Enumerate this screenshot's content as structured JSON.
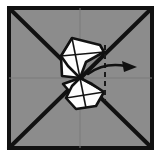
{
  "figure": {
    "title": "Origami fold step diagram",
    "caption": "Square paper with diagonal creases and a central bow-tie flap being folded to the right",
    "canvas": {
      "width": 161,
      "height": 157
    },
    "background_color": "#ffffff"
  },
  "paper": {
    "name": "square-sheet",
    "fill_color": "#8c8c8c",
    "border_color": "#111111",
    "border_width": 4,
    "rect": {
      "x": 7,
      "y": 6,
      "width": 147,
      "height": 144
    }
  },
  "creases": {
    "diagonal_color": "#111111",
    "diagonal_width": 4,
    "center_line_color": "#7b7b7b",
    "center_line_width": 1,
    "diagonals": [
      {
        "name": "crease-diagonal-tl-br",
        "x1": 9,
        "y1": 8,
        "x2": 152,
        "y2": 148
      },
      {
        "name": "crease-diagonal-bl-tr",
        "x1": 9,
        "y1": 148,
        "x2": 152,
        "y2": 8
      }
    ],
    "center_lines": [
      {
        "name": "crease-center-vertical",
        "x1": 80,
        "y1": 8,
        "x2": 80,
        "y2": 148
      },
      {
        "name": "crease-center-horizontal",
        "x1": 9,
        "y1": 78,
        "x2": 152,
        "y2": 78
      }
    ]
  },
  "flaps": {
    "fill_color": "#fdfdfd",
    "outline_color": "#111111",
    "outline_width": 2.6,
    "crease_color": "#111111",
    "crease_width": 1.6,
    "upper": {
      "name": "upper-flap",
      "outline_points": "72,38 100,45 104,52 86,62 80,78 68,66 61,56",
      "internal_creases": [
        {
          "name": "upper-crease-a",
          "x1": 72,
          "y1": 38,
          "x2": 80,
          "y2": 78
        },
        {
          "name": "upper-crease-b",
          "x1": 61,
          "y1": 56,
          "x2": 104,
          "y2": 52
        },
        {
          "name": "upper-crease-c",
          "x1": 72,
          "y1": 38,
          "x2": 61,
          "y2": 56
        }
      ]
    },
    "lower": {
      "name": "lower-flap",
      "outline_points": "80,78 92,84 104,92 96,106 76,109 66,98 72,86",
      "internal_creases": [
        {
          "name": "lower-crease-a",
          "x1": 80,
          "y1": 78,
          "x2": 86,
          "y2": 108
        },
        {
          "name": "lower-crease-b",
          "x1": 66,
          "y1": 98,
          "x2": 104,
          "y2": 92
        },
        {
          "name": "lower-crease-c",
          "x1": 80,
          "y1": 78,
          "x2": 104,
          "y2": 92
        }
      ]
    },
    "upper_small": {
      "name": "upper-small-flap",
      "outline_points": "61,56 80,78 62,76"
    },
    "lower_small": {
      "name": "lower-small-flap",
      "outline_points": "80,78 70,92 63,84"
    }
  },
  "annotations": {
    "fold_arrow": {
      "name": "fold-direction-arrow",
      "color": "#111111",
      "stroke_width": 2.4,
      "path": "M 88 74 Q 104 62 126 66",
      "head_points": "137,67 122,61 124,72",
      "description": "curved arrow pointing right"
    },
    "fold_line": {
      "name": "fold-dashed-line",
      "color": "#1a1a1a",
      "stroke_width": 2,
      "dash": "5 4",
      "x1": 105,
      "y1": 45,
      "x2": 105,
      "y2": 101,
      "description": "vertical dashed valley-fold line"
    }
  }
}
